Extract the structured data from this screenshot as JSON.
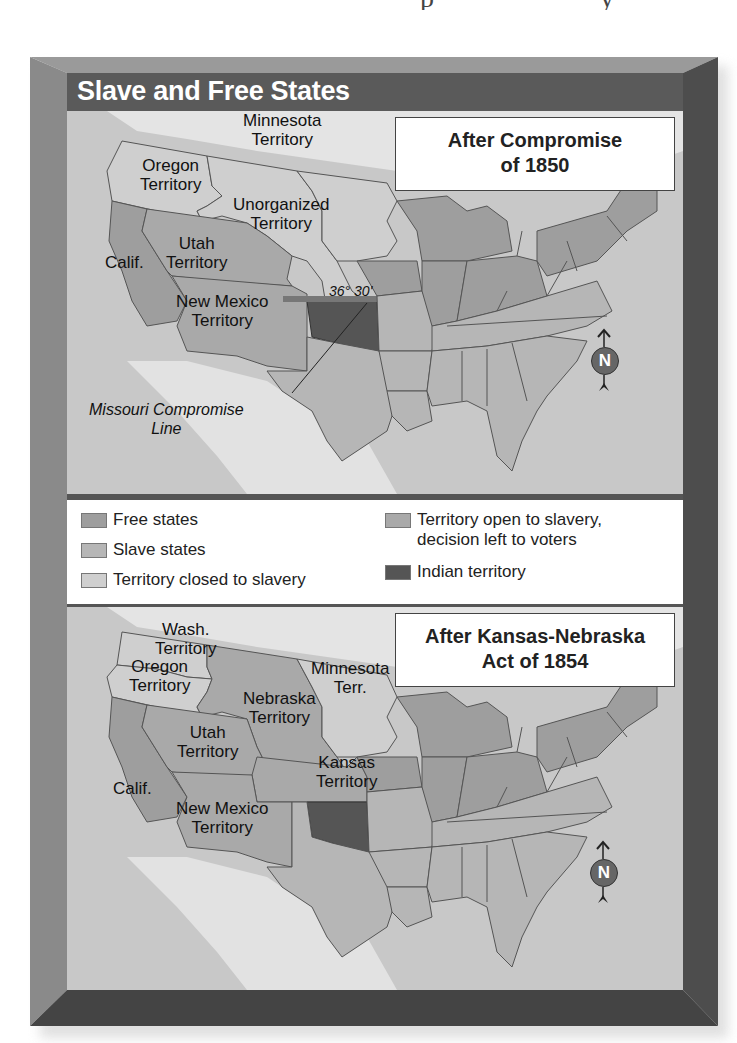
{
  "page": {
    "clipped_heading_fragment": "p                y"
  },
  "figure": {
    "title": "Slave and Free States",
    "colors": {
      "frame_light": "#8e8e8e",
      "frame_dark": "#4a4a4a",
      "title_bar": "#5a5a5a",
      "free_states": "#9e9e9e",
      "slave_states": "#b6b6b6",
      "territory_closed": "#cfcfcf",
      "territory_open": "#a9a9a9",
      "indian_territory": "#555555",
      "water": "#c8c8c8",
      "foreign_land": "#e6e6e6"
    }
  },
  "map_1850": {
    "title_line1": "After Compromise",
    "title_line2": "of 1850",
    "labels": {
      "minnesota_1": "Minnesota",
      "minnesota_2": "Territory",
      "oregon_1": "Oregon",
      "oregon_2": "Territory",
      "unorganized_1": "Unorganized",
      "unorganized_2": "Territory",
      "utah_1": "Utah",
      "utah_2": "Territory",
      "calif": "Calif.",
      "newmexico_1": "New Mexico",
      "newmexico_2": "Territory",
      "latitude": "36° 30'",
      "missouri_line_1": "Missouri Compromise",
      "missouri_line_2": "Line"
    },
    "compass_label": "N"
  },
  "legend": {
    "items": [
      {
        "label": "Free states",
        "color": "#9e9e9e"
      },
      {
        "label": "Slave states",
        "color": "#b6b6b6"
      },
      {
        "label": "Territory closed to slavery",
        "color": "#cfcfcf"
      },
      {
        "label_line1": "Territory open to slavery,",
        "label_line2": "decision left to voters",
        "color": "#a9a9a9"
      },
      {
        "label": "Indian territory",
        "color": "#555555"
      }
    ]
  },
  "map_1854": {
    "title_line1": "After Kansas-Nebraska",
    "title_line2": "Act of 1854",
    "labels": {
      "wash_1": "Wash.",
      "wash_2": "Territory",
      "oregon_1": "Oregon",
      "oregon_2": "Territory",
      "minnesota_1": "Minnesota",
      "minnesota_2": "Terr.",
      "nebraska_1": "Nebraska",
      "nebraska_2": "Territory",
      "utah_1": "Utah",
      "utah_2": "Territory",
      "kansas_1": "Kansas",
      "kansas_2": "Territory",
      "calif": "Calif.",
      "newmexico_1": "New Mexico",
      "newmexico_2": "Territory"
    },
    "compass_label": "N"
  }
}
